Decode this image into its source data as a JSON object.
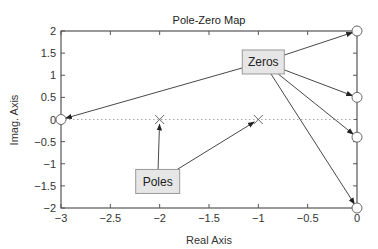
{
  "chart_data": {
    "type": "scatter",
    "title": "Pole-Zero Map",
    "xlabel": "Real Axis",
    "ylabel": "Imag. Axis",
    "xlim": [
      -3,
      0
    ],
    "ylim": [
      -2,
      2
    ],
    "xticks": [
      -3,
      -2.5,
      -2,
      -1.5,
      -1,
      -0.5,
      0
    ],
    "xtick_labels": [
      "−3",
      "−2.5",
      "−2",
      "−1.5",
      "−1",
      "−0.5",
      "0"
    ],
    "yticks": [
      2,
      1.5,
      1,
      0.5,
      0,
      -0.5,
      -1,
      -1.5,
      -2
    ],
    "ytick_labels": [
      "2",
      "1.5",
      "1",
      "0.5",
      "0",
      "−0.5",
      "−1",
      "−1.5",
      "−2"
    ],
    "grid": false,
    "zero_line": {
      "y": 0,
      "style": "dotted"
    },
    "series": [
      {
        "name": "Poles",
        "marker": "x",
        "points": [
          [
            -2,
            0
          ],
          [
            -1,
            0
          ]
        ]
      },
      {
        "name": "Zeros",
        "marker": "o",
        "points": [
          [
            -3,
            0
          ],
          [
            0,
            2
          ],
          [
            0,
            0.5
          ],
          [
            0,
            -0.4
          ],
          [
            0,
            -2
          ]
        ]
      }
    ],
    "annotations": [
      {
        "label": "Zeros",
        "box_at": [
          -0.95,
          1.3
        ],
        "arrows_to": [
          [
            -3,
            0
          ],
          [
            0,
            2
          ],
          [
            0,
            0.5
          ],
          [
            0,
            -0.4
          ],
          [
            0,
            -2
          ]
        ]
      },
      {
        "label": "Poles",
        "box_at": [
          -2.02,
          -1.4
        ],
        "arrows_to": [
          [
            -2,
            0
          ],
          [
            -1,
            0
          ]
        ]
      }
    ]
  },
  "colors": {
    "axis": "#555555",
    "arrow": "#333333",
    "box_fill": "#e6e6e6",
    "box_stroke": "#999999",
    "zero_line": "#aaaaaa",
    "marker": "#666666"
  }
}
